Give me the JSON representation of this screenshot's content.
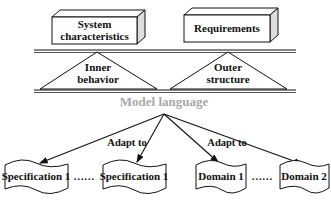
{
  "top_boxes": [
    {
      "id": "system-characteristics",
      "lines": [
        "System",
        "characteristics"
      ]
    },
    {
      "id": "requirements",
      "lines": [
        "Requirements"
      ]
    }
  ],
  "triangles": [
    {
      "id": "inner-behavior",
      "lines": [
        "Inner",
        "behavior"
      ]
    },
    {
      "id": "outer-structure",
      "lines": [
        "Outer",
        "structure"
      ]
    }
  ],
  "center_label": "Model language",
  "arrow_labels": [
    "Adapt to",
    "Adapt to"
  ],
  "bottom_docs": [
    {
      "id": "spec-1a",
      "label": "Specification 1"
    },
    {
      "id": "spec-1b",
      "label": "Specification 1"
    },
    {
      "id": "domain-1",
      "label": "Domain 1"
    },
    {
      "id": "domain-2",
      "label": "Domain 2"
    }
  ],
  "ellipsis": [
    "……",
    "……"
  ]
}
